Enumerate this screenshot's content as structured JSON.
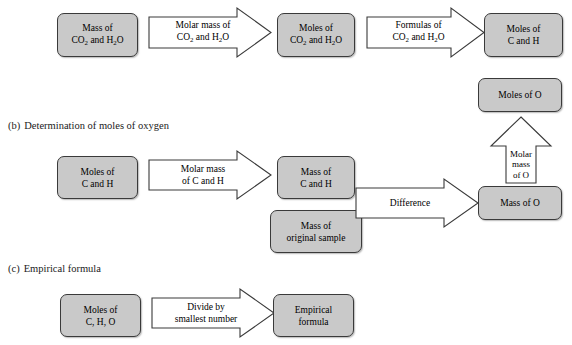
{
  "figure": {
    "sections": [
      {
        "index": "(a)",
        "label": "Determination of moles of carbon and hydrogen",
        "label_visible": false
      },
      {
        "index": "(b)",
        "label": "Determination of moles of oxygen",
        "label_visible": true
      },
      {
        "index": "(c)",
        "label": "Empirical formula",
        "label_visible": true
      }
    ],
    "row_a": {
      "box1": "Mass of\nCO2 and H2O",
      "arrow1": "Molar mass of\nCO2 and H2O",
      "box2": "Moles of\nCO2 and H2O",
      "arrow2": "Formulas of\nCO2 and H2O",
      "box3": "Moles of\nC and H"
    },
    "row_b": {
      "box1": "Moles of\nC and H",
      "arrow1": "Molar mass\nof C and H",
      "box2": "Mass of\nC and H",
      "box3": "Mass of\noriginal sample",
      "arrow2": "Difference",
      "box4": "Mass of O",
      "arrow_up": "Molar\nmass\nof O",
      "box5": "Moles of O"
    },
    "row_c": {
      "box1": "Moles of\nC, H, O",
      "arrow1": "Divide by\nsmallest number",
      "box2": "Empirical\nformula"
    },
    "colors": {
      "box_fill": "#c9c9c9",
      "box_border": "#3a3a3a",
      "arrow_fill": "#ffffff",
      "arrow_border": "#3a3a3a",
      "text": "#000000",
      "background": "#ffffff"
    }
  }
}
